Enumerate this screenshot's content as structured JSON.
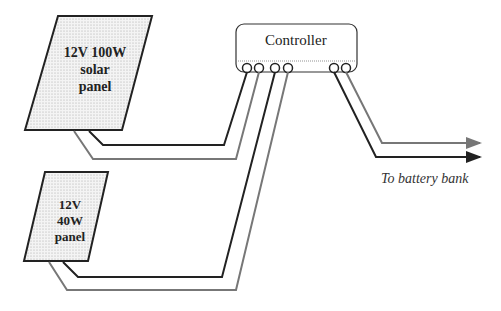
{
  "diagram": {
    "panels": [
      {
        "id": "large",
        "label_lines": [
          "12V 100W",
          "solar",
          "panel"
        ]
      },
      {
        "id": "small",
        "label_lines": [
          "12V",
          "40W",
          "panel"
        ]
      }
    ],
    "controller": {
      "label": "Controller",
      "terminals": 6
    },
    "output": {
      "label": "To battery bank"
    },
    "colors": {
      "dark_wire": "#222222",
      "light_wire": "#777777",
      "panel_fill": "#f2f2f2"
    }
  }
}
